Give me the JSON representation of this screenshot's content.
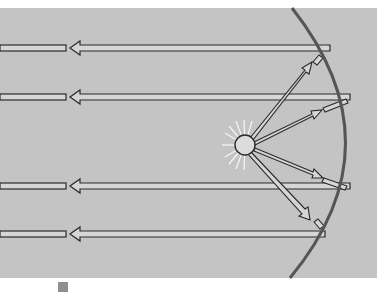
{
  "diagram": {
    "type": "parabolic-reflector",
    "colors": {
      "background": "#ffffff",
      "panel": "#c4c4c4",
      "mirror": "#555555",
      "arrow_fill": "#d6d6d6",
      "arrow_outline": "#2a2a2a",
      "glow": "#f2f2f2",
      "bulb_fill": "#dcdcdc",
      "legend_swatch": "#8f8f8f"
    },
    "source": {
      "label": "light-source",
      "x": 245,
      "y": 145,
      "r": 10
    },
    "incident_rays": [
      {
        "to": [
          330,
          55
        ]
      },
      {
        "to": [
          345,
          100
        ]
      },
      {
        "to": [
          340,
          185
        ]
      },
      {
        "to": [
          320,
          225
        ]
      }
    ],
    "reflected_beams": [
      {
        "y": 48
      },
      {
        "y": 97
      },
      {
        "y": 186
      },
      {
        "y": 234
      }
    ],
    "legend": {
      "swatch_color": "#8f8f8f"
    }
  }
}
